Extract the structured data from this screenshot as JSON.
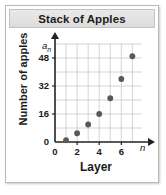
{
  "card": {
    "title": "Stack of Apples"
  },
  "chart_data": {
    "type": "scatter",
    "title": "Stack of Apples",
    "xlabel": "Layer",
    "ylabel": "Number of apples",
    "x_axis_variable": "n",
    "y_axis_variable": "a",
    "y_axis_variable_subscript": "n",
    "x": [
      1,
      2,
      3,
      4,
      5,
      6,
      7
    ],
    "values": [
      1,
      5,
      10,
      16,
      25,
      36,
      49
    ],
    "xlim": [
      0,
      7.6
    ],
    "ylim": [
      0,
      56
    ],
    "xticks": [
      0,
      2,
      4,
      6
    ],
    "xtick_labels": [
      "0",
      "2",
      "4",
      "6"
    ],
    "yticks": [
      0,
      16,
      32,
      48
    ],
    "ytick_labels": [
      "0",
      "16",
      "32",
      "48"
    ],
    "grid": true,
    "legend": false,
    "marker_color": "#595959"
  }
}
